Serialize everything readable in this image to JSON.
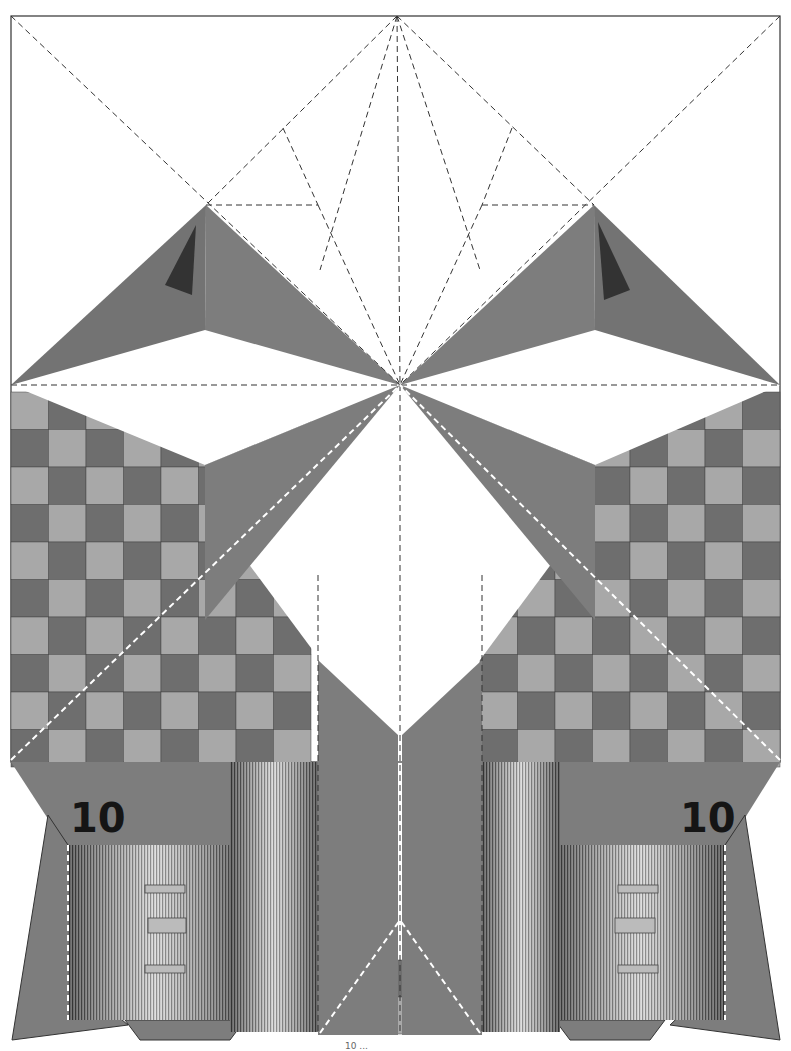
{
  "sheet": {
    "type": "papercraft fold template",
    "part_labels": [
      "10",
      "10"
    ],
    "caption": "10 ... ",
    "colors": {
      "paper": "#ffffff",
      "outline": "#333333",
      "panel_gray": "#7d7d7d",
      "checker_dark": "#6e6e6e",
      "checker_light": "#a8a8a8",
      "fold_line": "#333333",
      "label_text": "#151515"
    },
    "legend": {
      "fold_lines": "dashed",
      "cut_lines": "solid"
    }
  }
}
